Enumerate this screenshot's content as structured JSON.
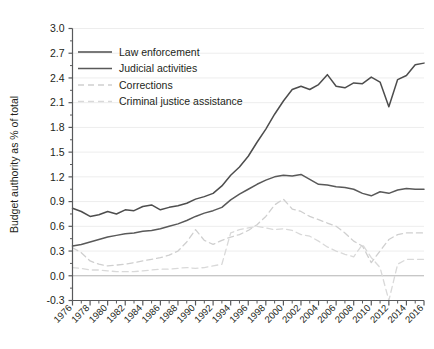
{
  "chart_data": {
    "type": "line",
    "title": "",
    "xlabel": "",
    "ylabel": "Budget authority as % of total",
    "xlim": [
      1976,
      2016
    ],
    "ylim": [
      -0.3,
      3.0
    ],
    "ytick_step": 0.3,
    "xtick_step": 2,
    "grid": true,
    "legend_position": "top-left",
    "yticks": [
      "3.0",
      "2.7",
      "2.4",
      "2.1",
      "1.8",
      "1.5",
      "1.2",
      "0.9",
      "0.6",
      "0.3",
      "0.0",
      "-0.3"
    ],
    "xticks": [
      "1976",
      "1978",
      "1980",
      "1982",
      "1984",
      "1986",
      "1988",
      "1990",
      "1992",
      "1994",
      "1996",
      "1998",
      "2000",
      "2002",
      "2004",
      "2006",
      "2008",
      "2010",
      "2012",
      "2014",
      "2016"
    ],
    "colors": {
      "law_enforcement": "#4d4d4d",
      "judicial_activities": "#595959",
      "corrections": "#cfcfcf",
      "criminal_justice_assistance": "#d9d9d9",
      "axis": "#58595b",
      "grid": "#ededed"
    },
    "x": [
      1976,
      1977,
      1978,
      1979,
      1980,
      1981,
      1982,
      1983,
      1984,
      1985,
      1986,
      1987,
      1988,
      1989,
      1990,
      1991,
      1992,
      1993,
      1994,
      1995,
      1996,
      1997,
      1998,
      1999,
      2000,
      2001,
      2002,
      2003,
      2004,
      2005,
      2006,
      2007,
      2008,
      2009,
      2010,
      2011,
      2012,
      2013,
      2014,
      2015,
      2016
    ],
    "series": [
      {
        "name": "Law enforcement",
        "style": "solid",
        "color": "#4d4d4d",
        "values": [
          0.82,
          0.78,
          0.72,
          0.74,
          0.78,
          0.75,
          0.8,
          0.79,
          0.84,
          0.86,
          0.8,
          0.83,
          0.85,
          0.88,
          0.93,
          0.96,
          1.0,
          1.09,
          1.22,
          1.32,
          1.45,
          1.62,
          1.78,
          1.96,
          2.12,
          2.26,
          2.3,
          2.26,
          2.32,
          2.44,
          2.3,
          2.28,
          2.34,
          2.33,
          2.41,
          2.35,
          2.05,
          2.38,
          2.43,
          2.56,
          2.58
        ]
      },
      {
        "name": "Judicial activities",
        "style": "solid",
        "color": "#595959",
        "values": [
          0.36,
          0.38,
          0.41,
          0.44,
          0.47,
          0.49,
          0.51,
          0.52,
          0.54,
          0.55,
          0.57,
          0.6,
          0.63,
          0.67,
          0.72,
          0.76,
          0.79,
          0.83,
          0.92,
          0.99,
          1.05,
          1.11,
          1.16,
          1.2,
          1.22,
          1.21,
          1.23,
          1.17,
          1.11,
          1.1,
          1.08,
          1.07,
          1.05,
          1.0,
          0.97,
          1.02,
          1.0,
          1.04,
          1.06,
          1.05,
          1.05
        ]
      },
      {
        "name": "Corrections",
        "style": "dashed",
        "color": "#cfcfcf",
        "values": [
          0.34,
          0.28,
          0.18,
          0.14,
          0.12,
          0.13,
          0.14,
          0.16,
          0.18,
          0.2,
          0.22,
          0.25,
          0.3,
          0.41,
          0.56,
          0.43,
          0.38,
          0.43,
          0.47,
          0.5,
          0.55,
          0.62,
          0.72,
          0.86,
          0.93,
          0.81,
          0.78,
          0.72,
          0.68,
          0.64,
          0.6,
          0.52,
          0.42,
          0.36,
          0.16,
          0.3,
          0.44,
          0.5,
          0.52,
          0.52,
          0.52
        ]
      },
      {
        "name": "Criminal justice assistance",
        "style": "dashed",
        "color": "#d9d9d9",
        "values": [
          0.1,
          0.09,
          0.07,
          0.07,
          0.06,
          0.05,
          0.05,
          0.05,
          0.06,
          0.07,
          0.08,
          0.08,
          0.09,
          0.1,
          0.09,
          0.1,
          0.12,
          0.14,
          0.52,
          0.56,
          0.58,
          0.6,
          0.58,
          0.56,
          0.57,
          0.55,
          0.5,
          0.48,
          0.42,
          0.35,
          0.3,
          0.26,
          0.23,
          0.38,
          0.22,
          0.1,
          -0.3,
          0.14,
          0.2,
          0.2,
          0.2
        ]
      }
    ]
  },
  "legend": {
    "items": [
      {
        "label": "Law enforcement"
      },
      {
        "label": "Judicial activities"
      },
      {
        "label": "Corrections"
      },
      {
        "label": "Criminal justice assistance"
      }
    ]
  }
}
